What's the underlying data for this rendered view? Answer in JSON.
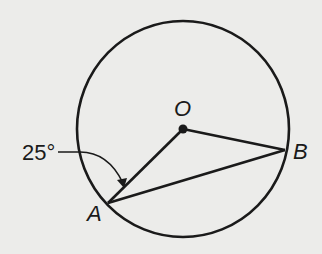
{
  "diagram": {
    "type": "circle-geometry",
    "colors": {
      "background": "#ececea",
      "ink": "#1a1a1a"
    },
    "circle": {
      "center_label": "O",
      "cx": 183,
      "cy": 129,
      "rx": 106,
      "ry": 108
    },
    "points": [
      {
        "label": "O",
        "x": 183,
        "y": 129
      },
      {
        "label": "A",
        "x": 108,
        "y": 203
      },
      {
        "label": "B",
        "x": 285,
        "y": 150
      }
    ],
    "segments": [
      {
        "from": "O",
        "to": "A"
      },
      {
        "from": "O",
        "to": "B"
      },
      {
        "from": "A",
        "to": "B"
      }
    ],
    "annotations": [
      {
        "text": "25°",
        "refers_to": "angle OAB"
      }
    ]
  },
  "labels": {
    "O": "O",
    "A": "A",
    "B": "B",
    "angle": "25°"
  }
}
